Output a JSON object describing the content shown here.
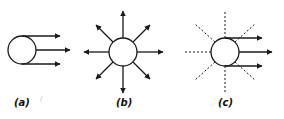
{
  "panels": [
    {
      "id": "a",
      "label": "(a)",
      "description": "Circle with three parallel arrows pointing right"
    },
    {
      "id": "b",
      "label": "(b)",
      "description": "Circle with eight arrows radiating outward in all directions"
    },
    {
      "id": "c",
      "label": "(c)",
      "description": "Circle with dashed radial lines and three arrows pointing right"
    }
  ],
  "stray_mark": "/",
  "colors": {
    "stroke": "#1a1a1a",
    "background": "#ffffff"
  }
}
